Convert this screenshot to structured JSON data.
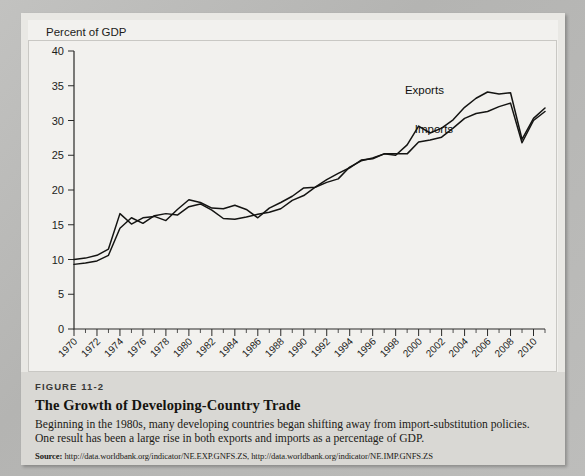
{
  "figure": {
    "number": "FIGURE 11-2",
    "title": "The Growth of Developing-Country Trade",
    "description": "Beginning in the 1980s, many developing countries began shifting away from import-substitution policies. One result has been a large rise in both exports and imports as a percentage of GDP.",
    "source_label": "Source:",
    "source_text": "http://data.worldbank.org/indicator/NE.EXP.GNFS.ZS, http://data.worldbank.org/indicator/NE.IMP.GNFS.ZS"
  },
  "chart_data": {
    "type": "line",
    "title": "",
    "ylabel": "Percent of GDP",
    "xlabel": "",
    "ylim": [
      0,
      40
    ],
    "yticks": [
      0,
      5,
      10,
      15,
      20,
      25,
      30,
      35,
      40
    ],
    "xlim": [
      1970,
      2011
    ],
    "xticks": [
      1970,
      1972,
      1974,
      1976,
      1978,
      1980,
      1982,
      1984,
      1986,
      1988,
      1990,
      1992,
      1994,
      1996,
      1998,
      2000,
      2002,
      2004,
      2006,
      2008,
      2010
    ],
    "minor_xtick_step": 1,
    "grid": false,
    "legend_position": "inline-labels",
    "x": [
      1970,
      1971,
      1972,
      1973,
      1974,
      1975,
      1976,
      1977,
      1978,
      1979,
      1980,
      1981,
      1982,
      1983,
      1984,
      1985,
      1986,
      1987,
      1988,
      1989,
      1990,
      1991,
      1992,
      1993,
      1994,
      1995,
      1996,
      1997,
      1998,
      1999,
      2000,
      2001,
      2002,
      2003,
      2004,
      2005,
      2006,
      2007,
      2008,
      2009,
      2010,
      2011
    ],
    "series": [
      {
        "name": "Exports",
        "values": [
          10.0,
          10.2,
          10.6,
          11.5,
          16.6,
          15.1,
          16.0,
          16.2,
          15.6,
          17.2,
          18.6,
          18.2,
          17.4,
          17.3,
          17.8,
          17.2,
          16.0,
          17.4,
          18.2,
          19.1,
          20.3,
          20.4,
          21.1,
          21.6,
          23.3,
          24.2,
          24.6,
          25.2,
          25.0,
          26.5,
          29.2,
          28.2,
          28.9,
          30.1,
          31.9,
          33.2,
          34.1,
          33.8,
          34.0,
          27.3,
          30.3,
          31.8
        ]
      },
      {
        "name": "Imports",
        "values": [
          9.3,
          9.5,
          9.8,
          10.6,
          14.5,
          16.0,
          15.2,
          16.3,
          16.6,
          16.4,
          17.6,
          18.0,
          17.1,
          15.9,
          15.8,
          16.1,
          16.5,
          16.8,
          17.3,
          18.5,
          19.2,
          20.4,
          21.5,
          22.4,
          23.2,
          24.3,
          24.5,
          25.2,
          25.2,
          25.2,
          26.9,
          27.2,
          27.6,
          28.9,
          30.3,
          31.0,
          31.3,
          32.0,
          32.5,
          26.8,
          30.0,
          31.3
        ]
      }
    ],
    "annotations": [
      {
        "text": "Exports",
        "x": 2002.2,
        "y": 33.8
      },
      {
        "text": "Imports",
        "x": 2003.0,
        "y": 28.2
      }
    ]
  }
}
